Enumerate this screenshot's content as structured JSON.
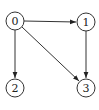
{
  "diagram": {
    "type": "directed-graph",
    "nodes": [
      {
        "id": "0",
        "label": "0",
        "cx": 15,
        "cy": 21
      },
      {
        "id": "1",
        "label": "1",
        "cx": 86,
        "cy": 22
      },
      {
        "id": "2",
        "label": "2",
        "cx": 15,
        "cy": 88
      },
      {
        "id": "3",
        "label": "3",
        "cx": 86,
        "cy": 88
      }
    ],
    "edges": [
      {
        "from": "0",
        "to": "1"
      },
      {
        "from": "0",
        "to": "2"
      },
      {
        "from": "0",
        "to": "3"
      },
      {
        "from": "1",
        "to": "3"
      }
    ],
    "node_radius": 9,
    "colors": {
      "stroke": "#333333",
      "fill": "#ffffff",
      "text": "#222222"
    }
  }
}
